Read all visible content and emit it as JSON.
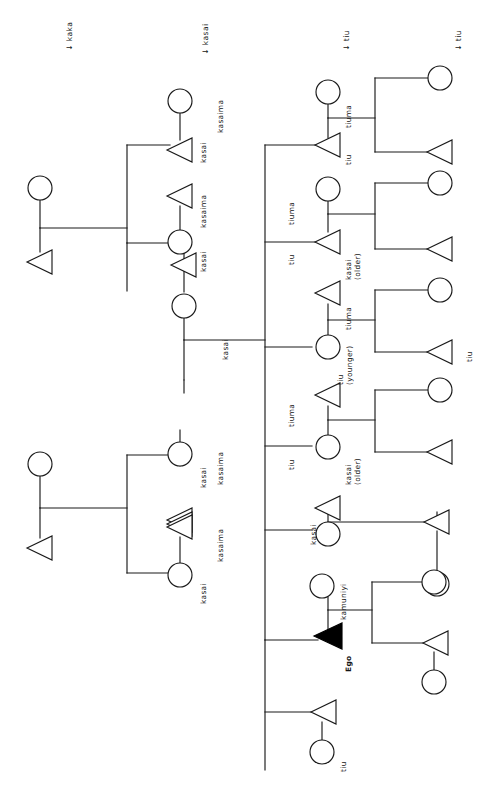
{
  "diagram": {
    "ego_label": "Ego",
    "colors": {
      "line": "#1a1a1a",
      "node_fill": "#ffffff",
      "ego_fill": "#000000",
      "text": "#141414"
    },
    "annotations": [
      {
        "id": "ann-kaka",
        "text": "kaka",
        "arrow": "↓"
      },
      {
        "id": "ann-kasai",
        "text": "kasai",
        "arrow": "↓"
      },
      {
        "id": "ann-tiu-1",
        "text": "tiu",
        "arrow": "↓"
      },
      {
        "id": "ann-tiu-2",
        "text": "tiu",
        "arrow": "↓"
      }
    ],
    "labels": [
      {
        "id": "lbl-1",
        "text": "kasaima"
      },
      {
        "id": "lbl-2",
        "text": "kasai"
      },
      {
        "id": "lbl-3",
        "text": "kasaima"
      },
      {
        "id": "lbl-4",
        "text": "kasai"
      },
      {
        "id": "lbl-5",
        "text": "kasai"
      },
      {
        "id": "lbl-6",
        "text": "kasaima"
      },
      {
        "id": "lbl-7",
        "text": "kasai"
      },
      {
        "id": "lbl-8",
        "text": "kasaima"
      },
      {
        "id": "lbl-9",
        "text": "kasai"
      },
      {
        "id": "lbl-10",
        "text": "tiuma"
      },
      {
        "id": "lbl-11",
        "text": "tiu"
      },
      {
        "id": "lbl-12",
        "text": "tiuma"
      },
      {
        "id": "lbl-13",
        "text": "tiu"
      },
      {
        "id": "lbl-14",
        "text": "kasai\n(older)"
      },
      {
        "id": "lbl-15",
        "text": "tiuma"
      },
      {
        "id": "lbl-16",
        "text": "tiu\n(younger)"
      },
      {
        "id": "lbl-17",
        "text": "tiu"
      },
      {
        "id": "lbl-18",
        "text": "tiuma"
      },
      {
        "id": "lbl-19",
        "text": "tiu"
      },
      {
        "id": "lbl-20",
        "text": "kasai\n(older)"
      },
      {
        "id": "lbl-21",
        "text": "kasai"
      },
      {
        "id": "lbl-22",
        "text": "kamuniyi"
      },
      {
        "id": "lbl-23",
        "text": "Ego"
      },
      {
        "id": "lbl-24",
        "text": "tiu"
      }
    ]
  }
}
